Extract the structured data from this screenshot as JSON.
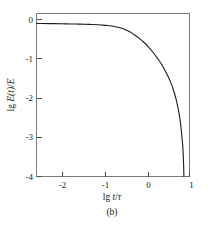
{
  "figure": {
    "caption": "(b)",
    "background_color": "#ffffff",
    "frame_color": "#7a7a7a",
    "curve_color": "#1b1b1b"
  },
  "chart_data": {
    "type": "line",
    "title": "",
    "subtitle": "",
    "caption": "(b)",
    "xlabel": "lg t/τ",
    "ylabel": "lg E(t)/E",
    "xlabel_parts": {
      "prefix": "lg ",
      "var1": "t",
      "sep": "/",
      "var2": "τ"
    },
    "ylabel_parts": {
      "prefix": "lg ",
      "var1": "E",
      "paren": "(t)",
      "sep": "/",
      "var2": "E"
    },
    "xlim": [
      -2.35,
      1.0
    ],
    "ylim": [
      -4.0,
      0.25
    ],
    "xticks": [
      -2,
      -1,
      0,
      1
    ],
    "xtick_labels": [
      "-2",
      "-1",
      "0",
      "1"
    ],
    "yticks": [
      0,
      -1,
      -2,
      -3,
      -4
    ],
    "ytick_labels": [
      "0",
      "-1",
      "-2",
      "-3",
      "-4"
    ],
    "grid": false,
    "legend": null,
    "legend_position": "none",
    "series": [
      {
        "name": "relaxation modulus decay",
        "x": [
          -2.35,
          -2.2,
          -2.0,
          -1.8,
          -1.6,
          -1.4,
          -1.2,
          -1.0,
          -0.9,
          -0.8,
          -0.7,
          -0.6,
          -0.5,
          -0.4,
          -0.3,
          -0.2,
          -0.1,
          0.0,
          0.1,
          0.2,
          0.3,
          0.4,
          0.5,
          0.58,
          0.65,
          0.71,
          0.76,
          0.8,
          0.83,
          0.855,
          0.87,
          0.878
        ],
        "y": [
          -0.01,
          -0.012,
          -0.015,
          -0.018,
          -0.022,
          -0.027,
          -0.034,
          -0.045,
          -0.052,
          -0.062,
          -0.078,
          -0.1,
          -0.13,
          -0.175,
          -0.235,
          -0.31,
          -0.4,
          -0.5,
          -0.62,
          -0.76,
          -0.92,
          -1.1,
          -1.32,
          -1.52,
          -1.75,
          -2.0,
          -2.28,
          -2.58,
          -2.92,
          -3.25,
          -3.65,
          -4.0
        ]
      }
    ]
  }
}
